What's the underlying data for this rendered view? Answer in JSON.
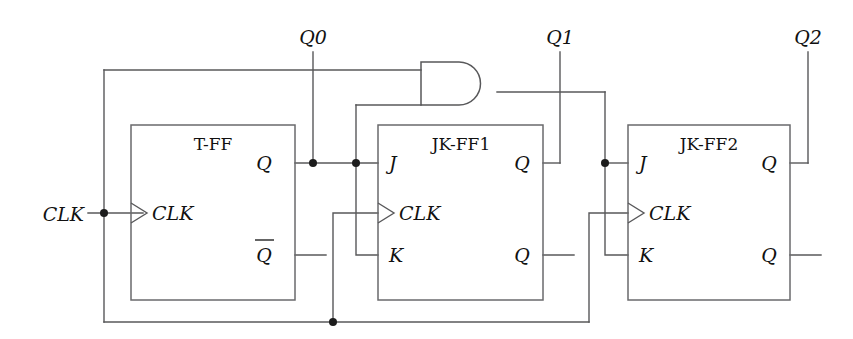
{
  "diagram": {
    "background_color": "#ffffff",
    "wire_color": "#58585a",
    "text_color": "#111111",
    "blocks": [
      {
        "id": "t-ff",
        "label": "T-FF",
        "pins": {
          "clk": "CLK",
          "q": "Q",
          "qbar": "Q"
        }
      },
      {
        "id": "jk-ff1",
        "label": "JK-FF1",
        "pins": {
          "j": "J",
          "clk": "CLK",
          "k": "K",
          "q_top": "Q",
          "q_bottom": "Q"
        }
      },
      {
        "id": "jk-ff2",
        "label": "JK-FF2",
        "pins": {
          "j": "J",
          "clk": "CLK",
          "k": "K",
          "q_top": "Q",
          "q_bottom": "Q"
        }
      }
    ],
    "gates": [
      {
        "id": "and-gate",
        "type": "AND",
        "inputs": 2,
        "label": ""
      }
    ],
    "signals": {
      "clk_input": "CLK",
      "q0": "Q0",
      "q1": "Q1",
      "q2": "Q2"
    }
  }
}
